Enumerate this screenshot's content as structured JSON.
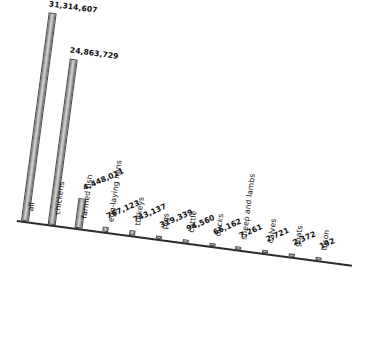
{
  "chart_data": {
    "type": "bar",
    "title": "",
    "subtitle": "",
    "xlabel": "",
    "ylabel": "",
    "grid": false,
    "legend": false,
    "axis_rotation_degrees": 7.6,
    "categories": [
      "all",
      "chickens",
      "farmed fish",
      "egg-laying hens",
      "turkeys",
      "pigs",
      "cattle",
      "ducks",
      "sheep and lambs",
      "calves",
      "goats",
      "bison"
    ],
    "values": [
      31314607,
      24863729,
      4448011,
      767123,
      743137,
      319339,
      94560,
      66162,
      7261,
      2721,
      2372,
      192
    ],
    "value_labels": [
      "31,314,607",
      "24,863,729",
      "4,448,011",
      "767,123",
      "743,137",
      "319,339",
      "94,560",
      "66,162",
      "7,261",
      "2,721",
      "2,372",
      "192"
    ],
    "ylim": [
      0,
      31314607
    ],
    "bar_color": "#b0b0b0",
    "bar_edge_color": "#4a4a4a",
    "axis_color": "#2b2b2b",
    "text_color": "#111111",
    "background_color": "#ffffff"
  }
}
